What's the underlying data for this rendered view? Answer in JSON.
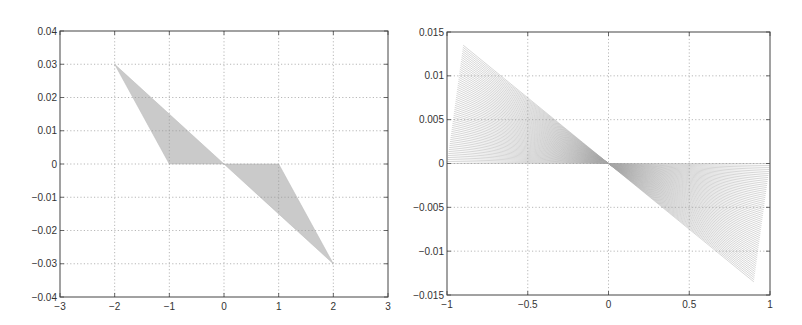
{
  "chart_data": [
    {
      "type": "area",
      "title": "",
      "xlabel": "",
      "ylabel": "",
      "xlim": [
        -3,
        3
      ],
      "ylim": [
        -0.04,
        0.04
      ],
      "grid": true,
      "xticks": [
        -3,
        -2,
        -1,
        0,
        1,
        2,
        3
      ],
      "xtick_labels": [
        "-3",
        "-2",
        "-1",
        "0",
        "1",
        "2",
        "3"
      ],
      "yticks": [
        -0.04,
        -0.03,
        -0.02,
        -0.01,
        0,
        0.01,
        0.02,
        0.03,
        0.04
      ],
      "ytick_labels": [
        "-0.04",
        "-0.03",
        "-0.02",
        "-0.01",
        "0",
        "0.01",
        "0.02",
        "0.03",
        "0.04"
      ],
      "series": [
        {
          "name": "upper-left shaded region",
          "polygon": [
            [
              -2,
              0.03
            ],
            [
              0,
              0
            ],
            [
              -1,
              0
            ]
          ]
        },
        {
          "name": "lower-right shaded region",
          "polygon": [
            [
              0,
              0
            ],
            [
              2,
              -0.03
            ],
            [
              1,
              0
            ]
          ]
        }
      ],
      "color": "#b8b8b8",
      "box": {
        "left": 60,
        "top": 31,
        "right": 388,
        "bottom": 297
      }
    },
    {
      "type": "line",
      "title": "",
      "xlabel": "",
      "ylabel": "",
      "xlim": [
        -1,
        1
      ],
      "ylim": [
        -0.015,
        0.015
      ],
      "grid": true,
      "xticks": [
        -1,
        -0.5,
        0,
        0.5,
        1
      ],
      "xtick_labels": [
        "-1",
        "-0.5",
        "0",
        "0.5",
        "1"
      ],
      "yticks": [
        -0.015,
        -0.01,
        -0.005,
        0,
        0.005,
        0.01,
        0.015
      ],
      "ytick_labels": [
        "-0.015",
        "-0.01",
        "-0.005",
        "0",
        "0.005",
        "0.01",
        "0.015"
      ],
      "series": [
        {
          "name": "fan of lines through origin",
          "description": "Family of line segments y = -k*x through (0,0); endpoints run from (-0.9, 0.0135) to (-1, 0) on the left and from (0.9, -0.0135) to (1, 0) on the right",
          "line_count": 60,
          "left_endpoint_start": [
            -0.9,
            0.0135
          ],
          "left_endpoint_end": [
            -1,
            0
          ],
          "right_endpoint_start": [
            0.9,
            -0.0135
          ],
          "right_endpoint_end": [
            1,
            0
          ]
        }
      ],
      "color": "#a8a8a8",
      "box": {
        "left": 447,
        "top": 32,
        "right": 770,
        "bottom": 295
      }
    }
  ]
}
